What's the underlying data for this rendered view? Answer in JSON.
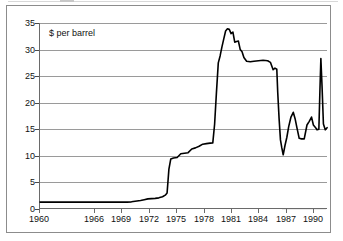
{
  "figure": {
    "series_label": "$ per barrel"
  },
  "chart_data": {
    "type": "line",
    "title": "",
    "subtitle": "",
    "xlabel": "",
    "ylabel": "$ per barrel",
    "annotations": [
      "$ per barrel"
    ],
    "legend": [],
    "legend_position": "none",
    "grid": true,
    "xlim": [
      1960,
      1991.5
    ],
    "ylim": [
      0,
      35
    ],
    "yticks": [
      0,
      5,
      10,
      15,
      20,
      25,
      30,
      35
    ],
    "ytick_labels": [
      "0",
      "5",
      "10",
      "15",
      "20",
      "25",
      "30",
      "35"
    ],
    "xticks": [
      1960,
      1966,
      1969,
      1972,
      1975,
      1978,
      1981,
      1984,
      1987,
      1990
    ],
    "xtick_labels": [
      "1960",
      "1966",
      "1969",
      "1972",
      "1975",
      "1978",
      "1981",
      "1984",
      "1987",
      "1990"
    ],
    "series": [
      {
        "name": "$ per barrel",
        "color": "#000000",
        "x": [
          1960.0,
          1962.0,
          1964.0,
          1966.0,
          1968.0,
          1969.5,
          1970.0,
          1970.6,
          1971.0,
          1971.4,
          1971.8,
          1972.2,
          1972.6,
          1973.0,
          1973.4,
          1973.7,
          1973.9,
          1974.1,
          1974.3,
          1974.6,
          1975.0,
          1975.4,
          1975.8,
          1976.2,
          1976.6,
          1977.0,
          1977.4,
          1977.8,
          1978.2,
          1978.6,
          1978.9,
          1979.1,
          1979.3,
          1979.5,
          1979.7,
          1979.9,
          1980.1,
          1980.3,
          1980.5,
          1980.7,
          1980.9,
          1981.1,
          1981.3,
          1981.5,
          1981.7,
          1981.9,
          1982.1,
          1982.3,
          1982.6,
          1983.0,
          1983.4,
          1983.9,
          1984.4,
          1984.9,
          1985.2,
          1985.5,
          1985.7,
          1985.9,
          1986.0,
          1986.15,
          1986.3,
          1986.45,
          1986.6,
          1986.8,
          1987.0,
          1987.2,
          1987.45,
          1987.7,
          1987.9,
          1988.1,
          1988.35,
          1988.6,
          1988.9,
          1989.2,
          1989.45,
          1989.7,
          1989.9,
          1990.1,
          1990.3,
          1990.5,
          1990.62,
          1990.72,
          1990.85,
          1991.0,
          1991.2,
          1991.4
        ],
        "y": [
          1.3,
          1.3,
          1.3,
          1.3,
          1.3,
          1.3,
          1.35,
          1.5,
          1.6,
          1.75,
          1.9,
          1.95,
          2.0,
          2.1,
          2.3,
          2.6,
          3.0,
          7.5,
          9.4,
          9.6,
          9.7,
          10.4,
          10.5,
          10.6,
          11.3,
          11.5,
          11.8,
          12.2,
          12.3,
          12.4,
          12.45,
          16.0,
          22.0,
          27.5,
          28.8,
          30.5,
          32.0,
          33.5,
          33.9,
          33.8,
          33.0,
          33.3,
          31.4,
          31.5,
          31.6,
          30.0,
          29.6,
          28.5,
          27.8,
          27.7,
          27.8,
          27.9,
          28.0,
          27.9,
          27.6,
          26.2,
          26.5,
          26.3,
          22.0,
          17.0,
          13.0,
          11.5,
          10.2,
          12.0,
          13.5,
          15.5,
          17.3,
          18.2,
          17.0,
          15.3,
          13.3,
          13.2,
          13.2,
          15.8,
          16.5,
          17.3,
          15.8,
          15.4,
          14.9,
          15.0,
          22.5,
          28.3,
          23.0,
          16.0,
          14.9,
          15.3
        ]
      }
    ]
  }
}
